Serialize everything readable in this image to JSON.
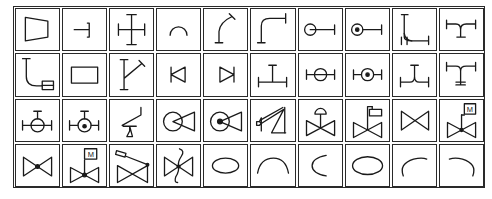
{
  "diagram": {
    "grid": {
      "rows": 4,
      "columns": 10
    },
    "colors": {
      "line": "#1a1a1a",
      "background": "#ffffff"
    },
    "rows": [
      {
        "symbols": [
          {
            "name": "reducer-icon",
            "label": ""
          },
          {
            "name": "cap-end-icon",
            "label": ""
          },
          {
            "name": "cross-tee-icon",
            "label": ""
          },
          {
            "name": "arc-bend-icon",
            "label": ""
          },
          {
            "name": "curved-bend-flanged-icon",
            "label": ""
          },
          {
            "name": "elbow-90-flanged-icon",
            "label": ""
          },
          {
            "name": "elbow-toward-icon",
            "label": ""
          },
          {
            "name": "elbow-away-icon",
            "label": ""
          },
          {
            "name": "double-elbow-icon",
            "label": ""
          },
          {
            "name": "y-branch-icon",
            "label": ""
          }
        ]
      },
      {
        "symbols": [
          {
            "name": "hose-connection-icon",
            "label": ""
          },
          {
            "name": "rectangle-icon",
            "label": ""
          },
          {
            "name": "lateral-branch-icon",
            "label": ""
          },
          {
            "name": "check-left-icon",
            "label": ""
          },
          {
            "name": "check-right-icon",
            "label": ""
          },
          {
            "name": "tee-icon",
            "label": ""
          },
          {
            "name": "tee-toward-icon",
            "label": ""
          },
          {
            "name": "tee-away-icon",
            "label": ""
          },
          {
            "name": "y-tee-icon",
            "label": ""
          },
          {
            "name": "tee-offset-icon",
            "label": ""
          }
        ]
      },
      {
        "symbols": [
          {
            "name": "plug-valve-icon",
            "label": ""
          },
          {
            "name": "plug-valve-dot-icon",
            "label": ""
          },
          {
            "name": "weight-loaded-valve-icon",
            "label": ""
          },
          {
            "name": "ball-check-icon",
            "label": ""
          },
          {
            "name": "ball-check-dot-icon",
            "label": ""
          },
          {
            "name": "spring-safety-valve-icon",
            "label": ""
          },
          {
            "name": "diaphragm-valve-icon",
            "label": ""
          },
          {
            "name": "solenoid-valve-icon",
            "label": ""
          },
          {
            "name": "gate-valve-icon",
            "label": ""
          },
          {
            "name": "motor-valve-icon",
            "label": "M"
          }
        ]
      },
      {
        "symbols": [
          {
            "name": "globe-valve-icon",
            "label": ""
          },
          {
            "name": "motor-globe-valve-icon",
            "label": "M"
          },
          {
            "name": "lever-valve-icon",
            "label": ""
          },
          {
            "name": "butterfly-s-valve-icon",
            "label": ""
          },
          {
            "name": "ellipse-icon",
            "label": ""
          },
          {
            "name": "arc-top-icon",
            "label": ""
          },
          {
            "name": "arc-left-icon",
            "label": ""
          },
          {
            "name": "ellipse-wide-icon",
            "label": ""
          },
          {
            "name": "arc-top-left-icon",
            "label": ""
          },
          {
            "name": "arc-top-right-icon",
            "label": ""
          }
        ]
      }
    ]
  }
}
